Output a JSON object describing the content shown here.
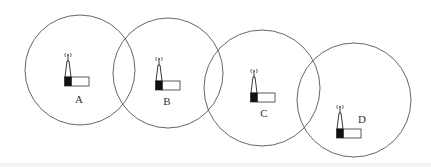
{
  "diagram": {
    "type": "cellular coverage cells with base stations",
    "stroke_color": "#555555",
    "cells": [
      {
        "id": "A",
        "label": "A",
        "cx": 80,
        "cy": 70,
        "r": 55,
        "tower": {
          "x": 64,
          "y": 52
        },
        "label_pos": {
          "x": 79,
          "y": 103
        }
      },
      {
        "id": "B",
        "label": "B",
        "cx": 168,
        "cy": 73,
        "r": 55,
        "tower": {
          "x": 155,
          "y": 56
        },
        "label_pos": {
          "x": 167,
          "y": 105
        }
      },
      {
        "id": "C",
        "label": "C",
        "cx": 262,
        "cy": 88,
        "r": 58,
        "tower": {
          "x": 250,
          "y": 68
        },
        "label_pos": {
          "x": 264,
          "y": 117
        }
      },
      {
        "id": "D",
        "label": "D",
        "cx": 354,
        "cy": 100,
        "r": 57,
        "tower": {
          "x": 336,
          "y": 104
        },
        "label_pos": {
          "x": 362,
          "y": 123
        }
      }
    ],
    "icon": "base-station-icon"
  }
}
